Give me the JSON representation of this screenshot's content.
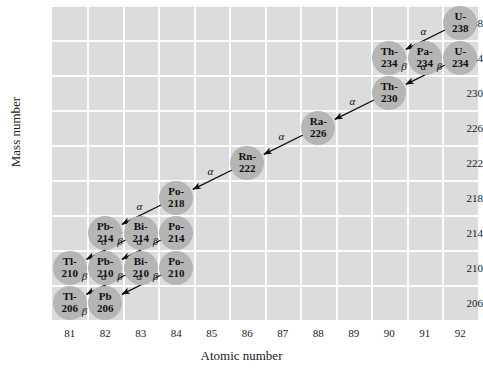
{
  "chart_data": {
    "type": "scatter",
    "title": "",
    "xlabel": "Atomic number",
    "ylabel": "Mass number",
    "xlim": [
      80.5,
      92.5
    ],
    "ylim": [
      204,
      240
    ],
    "xticks": [
      81,
      82,
      83,
      84,
      85,
      86,
      87,
      88,
      89,
      90,
      91,
      92
    ],
    "yticks": [
      206,
      210,
      214,
      218,
      222,
      226,
      230,
      234,
      238
    ],
    "grid": true,
    "legend": "none",
    "nodes": [
      {
        "label": "U-238",
        "line1": "U-",
        "line2": "238",
        "z": 92,
        "a": 238
      },
      {
        "label": "Th-234",
        "line1": "Th-",
        "line2": "234",
        "z": 90,
        "a": 234
      },
      {
        "label": "Pa-234",
        "line1": "Pa-",
        "line2": "234",
        "z": 91,
        "a": 234
      },
      {
        "label": "U-234",
        "line1": "U-",
        "line2": "234",
        "z": 92,
        "a": 234
      },
      {
        "label": "Th-230",
        "line1": "Th-",
        "line2": "230",
        "z": 90,
        "a": 230
      },
      {
        "label": "Ra-226",
        "line1": "Ra-",
        "line2": "226",
        "z": 88,
        "a": 226
      },
      {
        "label": "Rn-222",
        "line1": "Rn-",
        "line2": "222",
        "z": 86,
        "a": 222
      },
      {
        "label": "Po-218",
        "line1": "Po-",
        "line2": "218",
        "z": 84,
        "a": 218
      },
      {
        "label": "Pb-214",
        "line1": "Pb-",
        "line2": "214",
        "z": 82,
        "a": 214
      },
      {
        "label": "Bi-214",
        "line1": "Bi-",
        "line2": "214",
        "z": 83,
        "a": 214
      },
      {
        "label": "Po-214",
        "line1": "Po-",
        "line2": "214",
        "z": 84,
        "a": 214
      },
      {
        "label": "Tl-210",
        "line1": "Tl-",
        "line2": "210",
        "z": 81,
        "a": 210
      },
      {
        "label": "Pb-210",
        "line1": "Pb-",
        "line2": "210",
        "z": 82,
        "a": 210
      },
      {
        "label": "Bi-210",
        "line1": "Bi-",
        "line2": "210",
        "z": 83,
        "a": 210
      },
      {
        "label": "Po-210",
        "line1": "Po-",
        "line2": "210",
        "z": 84,
        "a": 210
      },
      {
        "label": "Tl-206",
        "line1": "Tl-",
        "line2": "206",
        "z": 81,
        "a": 206
      },
      {
        "label": "Pb-206",
        "line1": "Pb",
        "line2": "206",
        "z": 82,
        "a": 206
      }
    ],
    "decays": [
      {
        "from": "U-238",
        "to": "Th-234",
        "type": "alpha",
        "symbol": "α"
      },
      {
        "from": "Th-234",
        "to": "Pa-234",
        "type": "beta",
        "symbol": "β"
      },
      {
        "from": "Pa-234",
        "to": "U-234",
        "type": "beta",
        "symbol": "β"
      },
      {
        "from": "U-234",
        "to": "Th-230",
        "type": "alpha",
        "symbol": "α"
      },
      {
        "from": "Th-230",
        "to": "Ra-226",
        "type": "alpha",
        "symbol": "α"
      },
      {
        "from": "Ra-226",
        "to": "Rn-222",
        "type": "alpha",
        "symbol": "α"
      },
      {
        "from": "Rn-222",
        "to": "Po-218",
        "type": "alpha",
        "symbol": "α"
      },
      {
        "from": "Po-218",
        "to": "Pb-214",
        "type": "alpha",
        "symbol": "α"
      },
      {
        "from": "Pb-214",
        "to": "Bi-214",
        "type": "beta",
        "symbol": "β"
      },
      {
        "from": "Bi-214",
        "to": "Po-214",
        "type": "beta",
        "symbol": "β"
      },
      {
        "from": "Bi-214",
        "to": "Tl-210",
        "type": "alpha",
        "symbol": "α"
      },
      {
        "from": "Po-214",
        "to": "Pb-210",
        "type": "alpha",
        "symbol": "α"
      },
      {
        "from": "Tl-210",
        "to": "Pb-210",
        "type": "beta",
        "symbol": "β"
      },
      {
        "from": "Pb-210",
        "to": "Bi-210",
        "type": "beta",
        "symbol": "β"
      },
      {
        "from": "Bi-210",
        "to": "Po-210",
        "type": "beta",
        "symbol": "β"
      },
      {
        "from": "Bi-210",
        "to": "Tl-206",
        "type": "alpha",
        "symbol": "α"
      },
      {
        "from": "Po-210",
        "to": "Pb-206",
        "type": "alpha",
        "symbol": "α"
      },
      {
        "from": "Tl-206",
        "to": "Pb-206",
        "type": "beta",
        "symbol": "β"
      }
    ]
  },
  "colors": {
    "plot_background": "#dcdcdc",
    "gridline": "#fcfcfc",
    "node_fill": "#b5b5b5",
    "arrow": "#0d0d0d",
    "text": "#1a1a1a"
  }
}
